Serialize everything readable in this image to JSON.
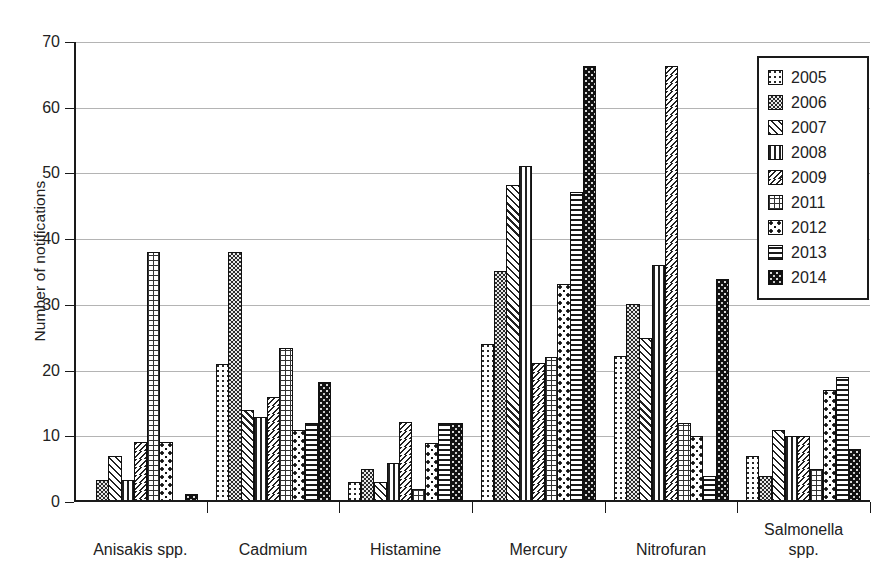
{
  "chart_data": {
    "type": "bar",
    "title": "",
    "xlabel": "",
    "ylabel": "Number of notifications",
    "ylim": [
      0,
      70
    ],
    "ytick_values": [
      0,
      10,
      20,
      30,
      40,
      50,
      60,
      70
    ],
    "ytick_labels": [
      "0",
      "10",
      "20",
      "30",
      "40",
      "50",
      "60",
      "70"
    ],
    "grid": true,
    "legend_position": "top-right",
    "categories": [
      "Anisakis spp.",
      "Cadmium",
      "Histamine",
      "Mercury",
      "Nitrofuran",
      "Salmonella\nspp."
    ],
    "series": [
      {
        "name": "2005",
        "pattern": "sparse-dots",
        "values": [
          0,
          21,
          3,
          24,
          22.2,
          7
        ]
      },
      {
        "name": "2006",
        "pattern": "dark-checker",
        "values": [
          3.3,
          38,
          5,
          35.2,
          30.2,
          4
        ]
      },
      {
        "name": "2007",
        "pattern": "diagonal-hatch",
        "values": [
          7,
          14,
          3,
          48.2,
          25,
          11
        ]
      },
      {
        "name": "2008",
        "pattern": "vertical-lines",
        "values": [
          3.3,
          13,
          6,
          51.2,
          36,
          10
        ]
      },
      {
        "name": "2009",
        "pattern": "wave-zigzag",
        "values": [
          9.2,
          16,
          12.2,
          21.2,
          66.4,
          10
        ]
      },
      {
        "name": "2011",
        "pattern": "fine-grid",
        "values": [
          38,
          23.5,
          2,
          22,
          12,
          5
        ]
      },
      {
        "name": "2012",
        "pattern": "confetti-dots",
        "values": [
          9.2,
          11,
          9,
          33.2,
          10,
          17
        ]
      },
      {
        "name": "2013",
        "pattern": "horizontal-lines",
        "values": [
          0,
          12,
          12,
          47.2,
          4,
          19
        ]
      },
      {
        "name": "2014",
        "pattern": "dark-speckle",
        "values": [
          1.2,
          18.2,
          12,
          66.4,
          34,
          8
        ]
      }
    ],
    "colors": {
      "axis": "#1a1a1a",
      "gridline": "#b4b4b4",
      "bar_outline": "#111111",
      "text": "#222222",
      "background": "#ffffff"
    }
  },
  "legend": {
    "entries": [
      "2005",
      "2006",
      "2007",
      "2008",
      "2009",
      "2011",
      "2012",
      "2013",
      "2014"
    ]
  }
}
